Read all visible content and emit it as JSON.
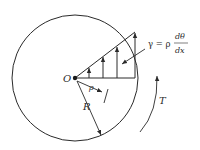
{
  "diagram": {
    "labels": {
      "origin": "O",
      "rho": "ρ",
      "radius": "R",
      "torque": "T",
      "gamma_lhs": "γ = ρ",
      "frac_num": "dθ",
      "frac_den": "dx"
    },
    "colors": {
      "stroke": "#2a2a2a",
      "background": "#ffffff"
    }
  }
}
